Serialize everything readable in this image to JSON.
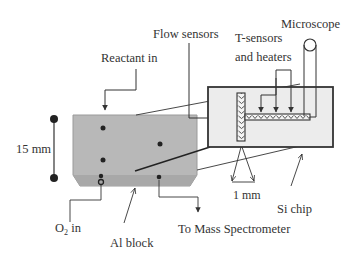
{
  "diagram": {
    "labels": {
      "reactant_in": "Reactant in",
      "flow_sensors": "Flow sensors",
      "t_sensors_line1": "T-sensors",
      "t_sensors_line2": "and heaters",
      "microscope": "Microscope",
      "dimension_15mm": "15 mm",
      "dimension_1mm": "1 mm",
      "si_chip": "Si chip",
      "o2_in_main": "O",
      "o2_in_sub": "2",
      "o2_in_tail": " in",
      "al_block": "Al block",
      "to_mass_spectrometer": "To Mass Spectrometer"
    },
    "colors": {
      "background": "#ffffff",
      "line": "#333333",
      "block_fill": "#b8b8b8",
      "block_bottom": "#a8a8a8",
      "chip_fill": "#ececec",
      "text": "#333333"
    }
  }
}
